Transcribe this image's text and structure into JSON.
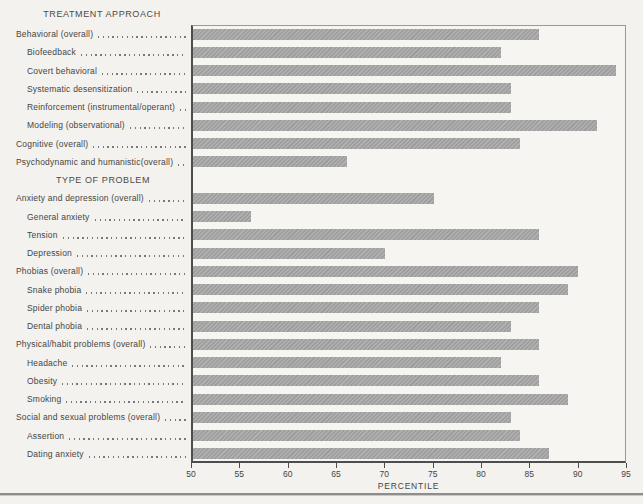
{
  "page": {
    "background_color": "#f3f2ee",
    "text_color": "#454545",
    "rule_color": "#8d8d8d"
  },
  "chart_data": {
    "type": "bar",
    "orientation": "horizontal",
    "title": "",
    "xlabel": "PERCENTILE",
    "ylabel": "",
    "xlim": [
      50,
      95
    ],
    "x_ticks": [
      50,
      55,
      60,
      65,
      70,
      75,
      80,
      85,
      90,
      95
    ],
    "grid": false,
    "legend": false,
    "bar_color": "#a6a6a6",
    "axis_color": "#4d4d4d",
    "frame_color": "#9a9a9a",
    "sections": [
      {
        "heading": "TREATMENT APPROACH",
        "items": [
          {
            "label": "Behavioral (overall)",
            "value": 86,
            "indent": 0
          },
          {
            "label": "Biofeedback",
            "value": 82,
            "indent": 1
          },
          {
            "label": "Covert behavioral",
            "value": 94,
            "indent": 1
          },
          {
            "label": "Systematic desensitization",
            "value": 83,
            "indent": 1
          },
          {
            "label": "Reinforcement (instrumental/operant)",
            "value": 83,
            "indent": 1
          },
          {
            "label": "Modeling (observational)",
            "value": 92,
            "indent": 1
          },
          {
            "label": "Cognitive (overall)",
            "value": 84,
            "indent": 0
          },
          {
            "label": "Psychodynamic and humanistic(overall)",
            "value": 66,
            "indent": 0
          }
        ]
      },
      {
        "heading": "TYPE OF PROBLEM",
        "items": [
          {
            "label": "Anxiety and depression (overall)",
            "value": 75,
            "indent": 0
          },
          {
            "label": "General anxiety",
            "value": 56,
            "indent": 1
          },
          {
            "label": "Tension",
            "value": 86,
            "indent": 1
          },
          {
            "label": "Depression",
            "value": 70,
            "indent": 1
          },
          {
            "label": "Phobias (overall)",
            "value": 90,
            "indent": 0
          },
          {
            "label": "Snake phobia",
            "value": 89,
            "indent": 1
          },
          {
            "label": "Spider phobia",
            "value": 86,
            "indent": 1
          },
          {
            "label": "Dental phobia",
            "value": 83,
            "indent": 1
          },
          {
            "label": "Physical/habit problems (overall)",
            "value": 86,
            "indent": 0
          },
          {
            "label": "Headache",
            "value": 82,
            "indent": 1
          },
          {
            "label": "Obesity",
            "value": 86,
            "indent": 1
          },
          {
            "label": "Smoking",
            "value": 89,
            "indent": 1
          },
          {
            "label": "Social and sexual problems (overall)",
            "value": 83,
            "indent": 0
          },
          {
            "label": "Assertion",
            "value": 84,
            "indent": 1
          },
          {
            "label": "Dating anxiety",
            "value": 87,
            "indent": 1
          }
        ]
      }
    ]
  }
}
